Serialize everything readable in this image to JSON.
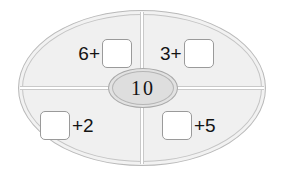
{
  "worksheet": {
    "type": "addition-fact-family-oval",
    "center": {
      "label": "center-total",
      "value": "10"
    },
    "quadrants": [
      {
        "position": "top-left",
        "layout": "number-first",
        "number": "6",
        "operator": "+",
        "answer": ""
      },
      {
        "position": "top-right",
        "layout": "number-first",
        "number": "3",
        "operator": "+",
        "answer": ""
      },
      {
        "position": "bottom-left",
        "layout": "box-first",
        "number": "2",
        "operator": "+",
        "answer": ""
      },
      {
        "position": "bottom-right",
        "layout": "box-first",
        "number": "5",
        "operator": "+",
        "answer": ""
      }
    ],
    "colors": {
      "page_background": "#ffffff",
      "ellipse_fill": "#f0f0f0",
      "ellipse_stroke": "#c0c0c0",
      "center_oval_fill": "#dedede",
      "center_oval_stroke": "#a8a8a8",
      "divider": "#c9c9c9",
      "answer_box_fill": "#ffffff",
      "answer_box_stroke": "#9a9a9a",
      "text": "#141414"
    }
  }
}
